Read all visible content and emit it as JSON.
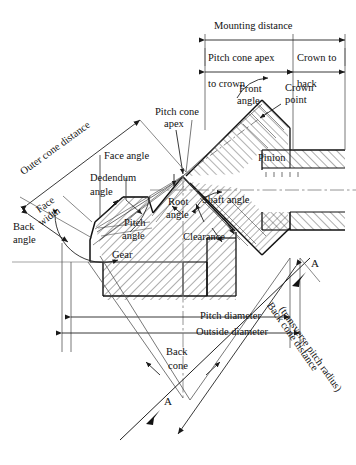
{
  "figure": {
    "type": "engineering-cross-section-diagram",
    "width": 356,
    "height": 465,
    "background_color": "#ffffff",
    "line_color": "#1a1a1a",
    "hatch_color": "#2a2a2a",
    "centerline_color": "#777777"
  },
  "labels": {
    "mounting_distance": "Mounting distance",
    "pitch_cone_apex_to_crown_line1": "Pitch cone apex",
    "pitch_cone_apex_to_crown_line2": "to crown",
    "crown_to_line1": "Crown to",
    "crown_to_line2": "back",
    "front_angle_line1": "Front",
    "front_angle_line2": "angle",
    "crown_point_line1": "Crown",
    "crown_point_line2": "point",
    "pitch_cone_apex_line1": "Pitch cone",
    "pitch_cone_apex_line2": "apex",
    "outer_cone_distance": "Outer cone distance",
    "face_angle": "Face angle",
    "dedendum_angle_line1": "Dedendum",
    "dedendum_angle_line2": "angle",
    "face_width_line1": "Face",
    "face_width_line2": "width",
    "back_angle_line1": "Back",
    "back_angle_line2": "angle",
    "pitch_angle_line1": "Pitch",
    "pitch_angle_line2": "angle",
    "root_angle_line1": "Root",
    "root_angle_line2": "angle",
    "shaft_angle": "Shaft angle",
    "clearance": "Clearance",
    "pinion": "Pinion",
    "gear": "Gear",
    "pitch_diameter": "Pitch diameter",
    "outside_diameter": "Outside diameter",
    "back_cone_line1": "Back",
    "back_cone_line2": "cone",
    "back_cone_distance_line1": "Back cone distance",
    "back_cone_distance_line2": "(transverse pitch radius)",
    "section_mark_upper": "A",
    "section_mark_lower": "A"
  }
}
